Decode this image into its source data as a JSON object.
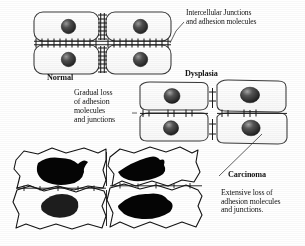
{
  "figure": {
    "canvas": {
      "width": 305,
      "height": 246,
      "background": "#ffffff"
    },
    "ink_color": "#141414",
    "nucleus_color": "#2b2b2b",
    "nucleus_highlight": "#8c8c8c",
    "carcinoma_nucleus_color": "#000000"
  },
  "labels": {
    "intercellular": "Intercellular Junctions\nand adhesion molecules",
    "normal": "Normal",
    "dysplasia": "Dysplasia",
    "gradual": "Gradual loss\nof adhesion\nmolecules\nand junctions",
    "carcinoma": "Carcinoma",
    "extensive": "Extensive loss of\nadhesion molecules\nand junctions."
  },
  "panels": [
    {
      "id": "normal",
      "label": "Normal",
      "description": "Four regular rounded rectangular epithelial cells in a 2x2 block with dense ladder-like intercellular junctions",
      "cell_count": 4,
      "cell_shape": "rounded-rectangle",
      "junction_density": "dense",
      "nucleus_shape": "round"
    },
    {
      "id": "dysplasia",
      "label": "Dysplasia",
      "description": "Four slightly irregular cells with reduced, sparse junction tick marks",
      "cell_count": 4,
      "cell_shape": "irregular-rounded",
      "junction_density": "sparse",
      "nucleus_shape": "round-to-oval"
    },
    {
      "id": "carcinoma",
      "label": "Carcinoma",
      "description": "Four highly irregular jagged cells with large pleomorphic dark nuclei and almost no junctions",
      "cell_count": 4,
      "cell_shape": "jagged-irregular",
      "junction_density": "minimal",
      "nucleus_shape": "pleomorphic-blob"
    }
  ],
  "leaders": [
    {
      "from": "intercellular-label",
      "to": "normal-junction"
    },
    {
      "from": "gradual-label",
      "to": "dysplasia-junction"
    },
    {
      "from": "carcinoma-label",
      "to": "carcinoma-cells"
    }
  ]
}
